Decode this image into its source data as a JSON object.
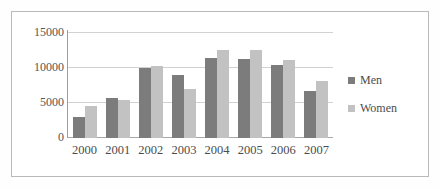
{
  "chart_data": {
    "type": "bar",
    "title": "",
    "xlabel": "",
    "ylabel": "",
    "categories": [
      "2000",
      "2001",
      "2002",
      "2003",
      "2004",
      "2005",
      "2006",
      "2007"
    ],
    "series": [
      {
        "name": "Men",
        "color": "#7c7c7c",
        "values": [
          3000,
          5600,
          9900,
          8900,
          11300,
          11250,
          10400,
          6700
        ]
      },
      {
        "name": "Women",
        "color": "#c2c2c2",
        "values": [
          4500,
          5400,
          10200,
          7000,
          12500,
          12500,
          11000,
          8000
        ]
      }
    ],
    "ylim": [
      0,
      15000
    ],
    "yticks": [
      "0",
      "5000",
      "10000",
      "15000"
    ],
    "ytick_values": [
      0,
      5000,
      10000,
      15000
    ],
    "grid": true,
    "legend_position": "right"
  }
}
